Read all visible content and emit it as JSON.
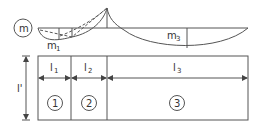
{
  "diagram": {
    "moment_label": "m",
    "m1_label": "m",
    "m1_sub": "1",
    "m3_label": "m",
    "m3_sub": "3",
    "spans": [
      {
        "label": "l",
        "sub": "1",
        "number": "1"
      },
      {
        "label": "l",
        "sub": "2",
        "number": "2"
      },
      {
        "label": "l",
        "sub": "3",
        "number": "3"
      }
    ],
    "height_label": "l'",
    "colors": {
      "line": "#555555",
      "text": "#333333",
      "background": "#ffffff"
    }
  }
}
